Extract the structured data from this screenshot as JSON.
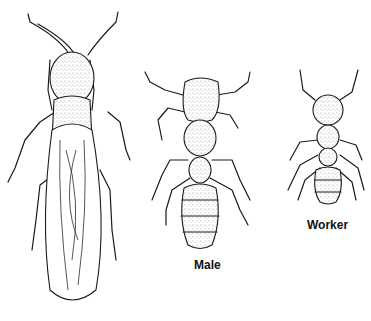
{
  "figure": {
    "subjects": [
      {
        "id": "winged-reproductive",
        "label": ""
      },
      {
        "id": "male",
        "label": "Male"
      },
      {
        "id": "worker",
        "label": "Worker"
      }
    ],
    "colors": {
      "line": "#1a1a1a",
      "background": "#ffffff"
    }
  }
}
